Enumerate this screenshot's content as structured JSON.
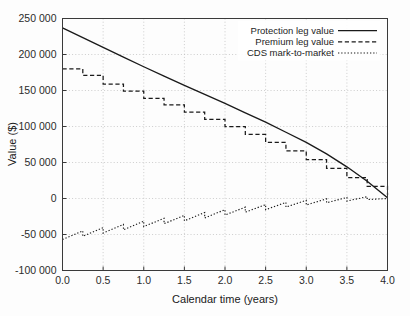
{
  "chart_data": {
    "type": "line",
    "title": "",
    "xlabel": "Calendar time (years)",
    "ylabel": "Value ($)",
    "xlim": [
      0.0,
      4.0
    ],
    "ylim": [
      -100000,
      250000
    ],
    "xticks": [
      0.0,
      0.5,
      1.0,
      1.5,
      2.0,
      2.5,
      3.0,
      3.5,
      4.0
    ],
    "xtick_labels": [
      "0.0",
      "0.5",
      "1.0",
      "1.5",
      "2.0",
      "2.5",
      "3.0",
      "3.5",
      "4.0"
    ],
    "yticks": [
      -100000,
      -50000,
      0,
      50000,
      100000,
      150000,
      200000,
      250000
    ],
    "ytick_labels": [
      "-100 000",
      "-50 000",
      "0",
      "50 000",
      "100 000",
      "150 000",
      "200 000",
      "250 000"
    ],
    "grid": true,
    "legend_position": "upper right",
    "series": [
      {
        "name": "Protection leg value",
        "style": "solid",
        "x": [
          0.0,
          0.25,
          0.5,
          0.75,
          1.0,
          1.25,
          1.5,
          1.75,
          2.0,
          2.25,
          2.5,
          2.75,
          3.0,
          3.25,
          3.5,
          3.75,
          4.0
        ],
        "values": [
          237000,
          223500,
          210000,
          196500,
          183000,
          170000,
          157000,
          144500,
          132000,
          119000,
          106000,
          92000,
          78000,
          62000,
          44000,
          24000,
          1000
        ]
      },
      {
        "name": "Premium leg value",
        "style": "dashed",
        "step": "post",
        "x": [
          0.0,
          0.25,
          0.5,
          0.75,
          1.0,
          1.25,
          1.5,
          1.75,
          2.0,
          2.25,
          2.5,
          2.75,
          3.0,
          3.25,
          3.5,
          3.75,
          4.0
        ],
        "values": [
          180000,
          171000,
          159000,
          149000,
          139000,
          130000,
          120000,
          110000,
          100000,
          89000,
          78000,
          66000,
          54000,
          42000,
          29000,
          17000,
          5000
        ]
      },
      {
        "name": "CDS mark-to-market",
        "style": "dotted",
        "sawtooth": true,
        "x": [
          0.0,
          0.25,
          0.5,
          0.75,
          1.0,
          1.25,
          1.5,
          1.75,
          2.0,
          2.25,
          2.5,
          2.75,
          3.0,
          3.25,
          3.5,
          3.75,
          4.0
        ],
        "values": [
          -57000,
          -52500,
          -48000,
          -43500,
          -39000,
          -35000,
          -31000,
          -27000,
          -23000,
          -19000,
          -15500,
          -12000,
          -9000,
          -6000,
          -3500,
          -1500,
          0
        ],
        "peak_values": [
          -57000,
          -45000,
          -40500,
          -36000,
          -31500,
          -27500,
          -23500,
          -19500,
          -15500,
          -12000,
          -8500,
          -5500,
          -2500,
          -500,
          1500,
          2500,
          0
        ]
      }
    ],
    "legend_entries": [
      {
        "label": "Protection leg value",
        "style": "solid"
      },
      {
        "label": "Premium leg value",
        "style": "dashed"
      },
      {
        "label": "CDS mark-to-market",
        "style": "dotted"
      }
    ]
  }
}
